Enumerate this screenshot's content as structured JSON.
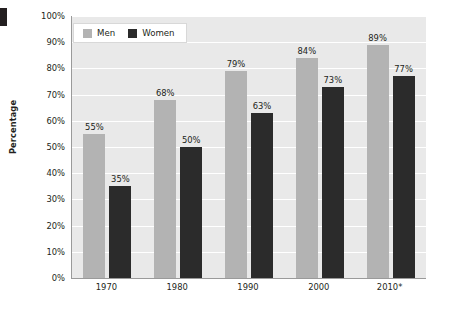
{
  "chart_data": {
    "type": "bar",
    "title": "",
    "xlabel": "",
    "ylabel": "Percentage",
    "categories": [
      "1970",
      "1980",
      "1990",
      "2000",
      "2010*"
    ],
    "series": [
      {
        "name": "Men",
        "color": "#b3b3b3",
        "values": [
          55,
          68,
          79,
          84,
          89
        ],
        "labels": [
          "55%",
          "68%",
          "79%",
          "84%",
          "89%"
        ]
      },
      {
        "name": "Women",
        "color": "#2b2b2b",
        "values": [
          35,
          50,
          63,
          73,
          77
        ],
        "labels": [
          "35%",
          "50%",
          "63%",
          "73%",
          "77%"
        ]
      }
    ],
    "ylim": [
      0,
      100
    ],
    "ytick_values": [
      0,
      10,
      20,
      30,
      40,
      50,
      60,
      70,
      80,
      90,
      100
    ],
    "ytick_labels": [
      "0%",
      "10%",
      "20%",
      "30%",
      "40%",
      "50%",
      "60%",
      "70%",
      "80%",
      "90%",
      "100%"
    ],
    "grid": "horizontal",
    "legend_position": "top-left",
    "plot_background": "#e9e9e9",
    "gridline_color": "#ffffff",
    "axis_color": "#9a9a9a",
    "text_color": "#231f20"
  },
  "axis": {
    "y_title": "Percentage"
  },
  "legend": {
    "items": [
      {
        "label": "Men"
      },
      {
        "label": "Women"
      }
    ]
  }
}
